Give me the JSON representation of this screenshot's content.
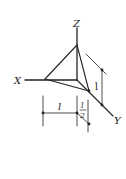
{
  "diagram": {
    "type": "3d-axes-tetrahedron-with-dimensions",
    "axes": {
      "x_label": "X",
      "y_label": "Y",
      "z_label": "Z"
    },
    "dimensions": {
      "right_length": "l",
      "bottom_length": "l",
      "half_numerator": "l",
      "half_denominator": "2"
    },
    "colors": {
      "stroke": "#222222",
      "background": "#ffffff"
    }
  }
}
